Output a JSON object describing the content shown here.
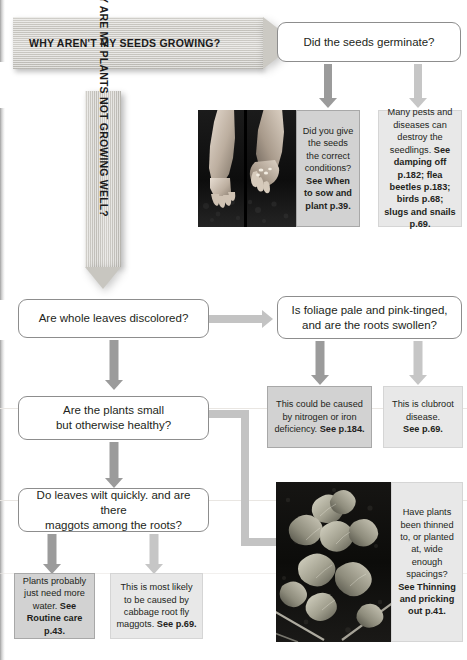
{
  "banners": {
    "seeds": {
      "text": "WHY AREN'T MY SEEDS GROWING?"
    },
    "plants": {
      "text": "WHY ARE MY PLANTS NOT GROWING WELL?"
    }
  },
  "questions": {
    "germinate": {
      "text": "Did the seeds germinate?"
    },
    "discolored": {
      "text": "Are whole leaves discolored?"
    },
    "foliage": {
      "line1": "Is foliage pale and pink-tinged,",
      "line2": "and are the roots swollen?"
    },
    "small": {
      "line1": "Are the plants small",
      "line2": "but otherwise healthy?"
    },
    "wilt": {
      "line1": "Do leaves wilt quickly. and are there",
      "line2": "maggots among the roots?"
    }
  },
  "answers": {
    "conditions": {
      "body": "Did you give the seeds the correct conditions?",
      "bold": "See When to sow and plant p.39.",
      "shade": "dark"
    },
    "pests": {
      "body": "Many pests and diseases can destroy the seedlings.",
      "bold": "See damping off p.182; flea beetles p.183; birds p.68; slugs and snails p.69.",
      "shade": "light"
    },
    "nitrogen": {
      "body": "This could be caused by nitrogen or iron deficiency. ",
      "bold": "See p.184.",
      "shade": "dark"
    },
    "clubroot": {
      "body": "This is clubroot disease.",
      "bold": "See p.69.",
      "shade": "light"
    },
    "water": {
      "body": "Plants probably just need more water.",
      "bold": "See Routine care p.43.",
      "shade": "dark"
    },
    "cabbage": {
      "body": "This is most likely to be caused by cabbage root fly maggots.",
      "bold": "See p.69.",
      "shade": "light"
    },
    "thinning": {
      "body": "Have plants been thinned to, or planted at, wide enough spacings?",
      "bold": "See Thinning and pricking out p.41.",
      "shade": "light"
    }
  },
  "photos": {
    "hands": {
      "caption": "hands sowing seeds into soil"
    },
    "seedlings": {
      "caption": "young leafy seedlings growing in a bed"
    }
  },
  "colors": {
    "box_border": "#8d8d8d",
    "answer_dark": "#d2d2d2",
    "answer_light": "#e8e8e8",
    "arrow_dark": "#9b9b9b",
    "arrow_light": "#c6c6c6",
    "connector": "#c3c3c3",
    "text": "#231f20"
  }
}
